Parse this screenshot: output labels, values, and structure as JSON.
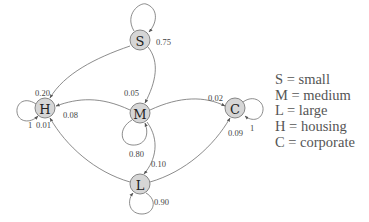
{
  "diagram": {
    "type": "markov-chain",
    "nodes": [
      {
        "id": "S",
        "label": "S",
        "cx": 140,
        "cy": 40
      },
      {
        "id": "M",
        "label": "M",
        "cx": 140,
        "cy": 113
      },
      {
        "id": "H",
        "label": "H",
        "cx": 45,
        "cy": 108
      },
      {
        "id": "C",
        "label": "C",
        "cx": 235,
        "cy": 108
      },
      {
        "id": "L",
        "label": "L",
        "cx": 140,
        "cy": 184
      }
    ],
    "edges": [
      {
        "from": "S",
        "to": "S",
        "prob": "0.75"
      },
      {
        "from": "S",
        "to": "H",
        "prob": "0.20"
      },
      {
        "from": "S",
        "to": "M",
        "prob": "0.05"
      },
      {
        "from": "M",
        "to": "M",
        "prob": "0.80"
      },
      {
        "from": "M",
        "to": "H",
        "prob": "0.08"
      },
      {
        "from": "M",
        "to": "C",
        "prob": "0.02"
      },
      {
        "from": "M",
        "to": "L",
        "prob": "0.10"
      },
      {
        "from": "L",
        "to": "L",
        "prob": "0.90"
      },
      {
        "from": "L",
        "to": "H",
        "prob": "0.01"
      },
      {
        "from": "L",
        "to": "C",
        "prob": "0.09"
      },
      {
        "from": "H",
        "to": "H",
        "prob": "1"
      },
      {
        "from": "C",
        "to": "C",
        "prob": "1"
      }
    ],
    "labels": {
      "s_self": "0.75",
      "s_h": "0.20",
      "s_m": "0.05",
      "m_self": "0.80",
      "m_h": "0.08",
      "m_c": "0.02",
      "m_l": "0.10",
      "l_self": "0.90",
      "l_h": "0.01",
      "l_c": "0.09",
      "h_self": "1",
      "c_self": "1"
    },
    "legend": [
      {
        "key": "S",
        "text": "S = small"
      },
      {
        "key": "M",
        "text": "M = medium"
      },
      {
        "key": "L",
        "text": "L = large"
      },
      {
        "key": "H",
        "text": "H = housing"
      },
      {
        "key": "C",
        "text": "C = corporate"
      }
    ],
    "colors": {
      "node_fill": "#d6d6d6",
      "node_stroke": "#7a7a7a",
      "edge": "#6e6e6e",
      "text": "#444444"
    }
  }
}
